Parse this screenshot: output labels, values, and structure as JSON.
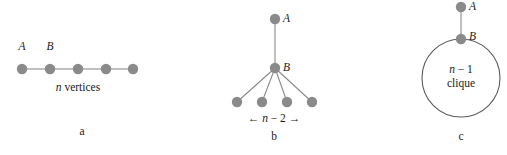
{
  "figure": {
    "node_color": "#8a8a8a",
    "edge_color": "#8a8a8a",
    "text_color": "#1a1a1a",
    "background": "#ffffff"
  },
  "panels": [
    {
      "id": "a",
      "caption": "a",
      "type": "path-graph",
      "node_count": 5,
      "node_labels": [
        "A",
        "B"
      ],
      "label_A": "A",
      "label_B": "B",
      "under_label_italic": "n",
      "under_label_plain": " vertices",
      "under_label_full": "n vertices"
    },
    {
      "id": "b",
      "caption": "b",
      "type": "star-tree",
      "label_A": "A",
      "label_B": "B",
      "leaf_count": 4,
      "bracket_left_arrow": "←",
      "bracket_right_arrow": "→",
      "bracket_italic": "n",
      "bracket_expr": " − 2 ",
      "bracket_full": "← n − 2 →"
    },
    {
      "id": "c",
      "caption": "c",
      "type": "clique-blob",
      "label_A": "A",
      "label_B": "B",
      "clique_line1_italic": "n",
      "clique_line1_rest": " − 1",
      "clique_line1": "n − 1",
      "clique_line2": "clique"
    }
  ]
}
